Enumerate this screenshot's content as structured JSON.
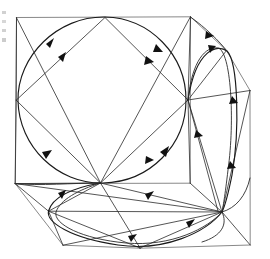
{
  "figure": {
    "title": "Hand-drawn geometric flow diagram",
    "background_color": "#ffffff",
    "ink_color": "#1a1a1a",
    "faint_ink_color": "#555555",
    "canvas": {
      "width": 270,
      "height": 259
    },
    "vertices": [
      {
        "id": "top",
        "label": "top-hub",
        "x": 105,
        "y": 17
      },
      {
        "id": "left",
        "label": "left-hub",
        "x": 16,
        "y": 100
      },
      {
        "id": "right",
        "label": "right-hub",
        "x": 188,
        "y": 100
      },
      {
        "id": "center",
        "label": "center-hub",
        "x": 100,
        "y": 183
      },
      {
        "id": "lower_left",
        "label": "lower-left-hub",
        "x": 48,
        "y": 211
      },
      {
        "id": "lower_right",
        "label": "lower-right-hub",
        "x": 222,
        "y": 212
      },
      {
        "id": "upper_right",
        "label": "upper-right-outer",
        "x": 226,
        "y": 50
      },
      {
        "id": "far_right",
        "label": "far-right-corner",
        "x": 250,
        "y": 90
      },
      {
        "id": "sq_tl",
        "label": "square-top-left",
        "x": 16,
        "y": 17
      },
      {
        "id": "sq_tr",
        "label": "square-top-right",
        "x": 190,
        "y": 17
      },
      {
        "id": "sq_bl",
        "label": "square-bottom-left",
        "x": 15,
        "y": 183
      },
      {
        "id": "sq_br",
        "label": "square-bottom-right",
        "x": 190,
        "y": 183
      },
      {
        "id": "bot_left",
        "label": "bottom-left-corner",
        "x": 63,
        "y": 245
      },
      {
        "id": "bot_mid",
        "label": "bottom-mid-corner",
        "x": 140,
        "y": 248
      },
      {
        "id": "bot_right",
        "label": "bottom-right-corner",
        "x": 250,
        "y": 245
      }
    ],
    "components": [
      {
        "name": "outer-square",
        "kind": "polygon",
        "stroke": "#555555"
      },
      {
        "name": "inner-diamond",
        "kind": "polygon",
        "stroke": "#2a2a2a"
      },
      {
        "name": "circumscribed-circle",
        "kind": "circle",
        "cx": 102,
        "cy": 100,
        "r": 84
      },
      {
        "name": "right-lobe",
        "kind": "lens",
        "stroke": "#1a1a1a"
      },
      {
        "name": "bottom-lobe",
        "kind": "lens",
        "stroke": "#1a1a1a"
      },
      {
        "name": "spoke-fan",
        "kind": "lines",
        "stroke": "#2a2a2a"
      }
    ],
    "arrow_count": 16,
    "margin_marks": 4
  }
}
